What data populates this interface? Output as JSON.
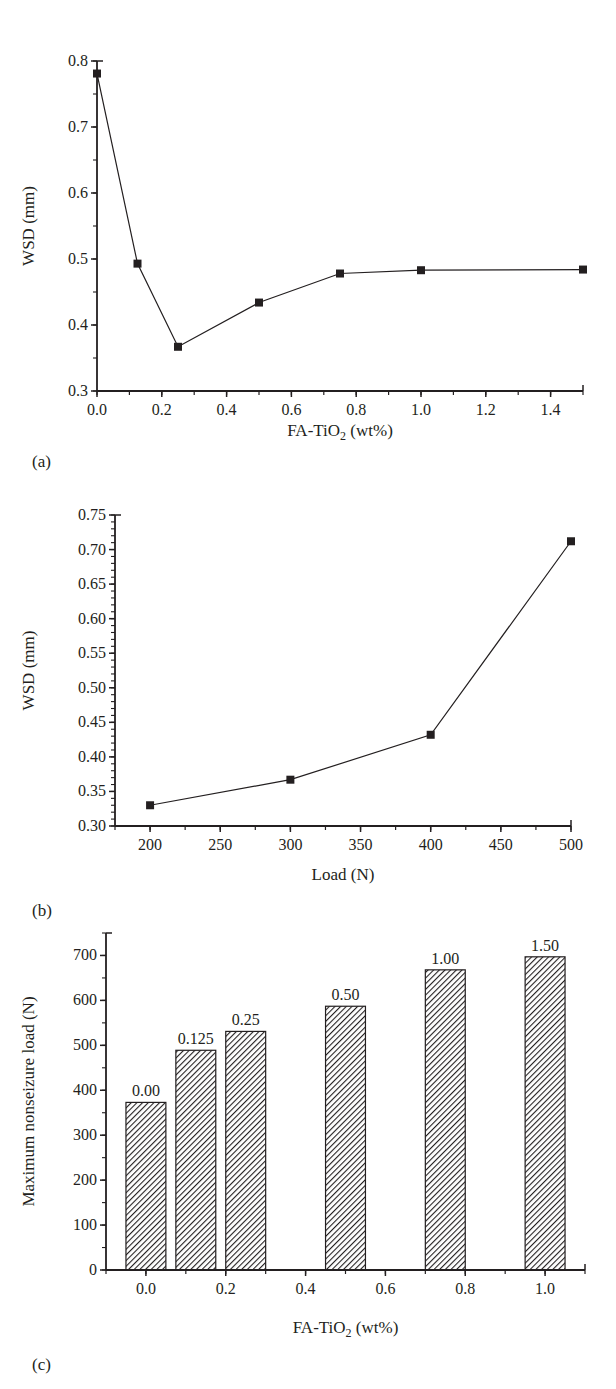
{
  "chart_data": [
    {
      "panel": "(a)",
      "type": "line",
      "title": "",
      "xlabel": "FA-TiO2 (wt%)",
      "ylabel": "WSD (mm)",
      "xlim": [
        0.0,
        1.5
      ],
      "ylim": [
        0.3,
        0.8
      ],
      "xticks": [
        0.0,
        0.2,
        0.4,
        0.6,
        0.8,
        1.0,
        1.2,
        1.4
      ],
      "xtick_labels": [
        "0.0",
        "0.2",
        "0.4",
        "0.6",
        "0.8",
        "1.0",
        "1.2",
        "1.4"
      ],
      "yticks": [
        0.3,
        0.4,
        0.5,
        0.6,
        0.7,
        0.8
      ],
      "ytick_labels": [
        "0.3",
        "0.4",
        "0.5",
        "0.6",
        "0.7",
        "0.8"
      ],
      "grid": false,
      "legend": null,
      "marker": "square",
      "series": [
        {
          "name": "WSD",
          "x": [
            0.0,
            0.125,
            0.25,
            0.5,
            0.75,
            1.0,
            1.5
          ],
          "y": [
            0.781,
            0.493,
            0.367,
            0.434,
            0.478,
            0.483,
            0.484
          ]
        }
      ]
    },
    {
      "panel": "(b)",
      "type": "line",
      "title": "",
      "xlabel": "Load (N)",
      "ylabel": "WSD (mm)",
      "xlim": [
        175,
        500
      ],
      "ylim": [
        0.3,
        0.75
      ],
      "xticks": [
        200,
        250,
        300,
        350,
        400,
        450,
        500
      ],
      "xtick_labels": [
        "200",
        "250",
        "300",
        "350",
        "400",
        "450",
        "500"
      ],
      "yticks": [
        0.3,
        0.35,
        0.4,
        0.45,
        0.5,
        0.55,
        0.6,
        0.65,
        0.7,
        0.75
      ],
      "ytick_labels": [
        "0.30",
        "0.35",
        "0.40",
        "0.45",
        "0.50",
        "0.55",
        "0.60",
        "0.65",
        "0.70",
        "0.75"
      ],
      "grid": false,
      "legend": null,
      "marker": "square",
      "series": [
        {
          "name": "WSD",
          "x": [
            200,
            300,
            400,
            500
          ],
          "y": [
            0.33,
            0.367,
            0.432,
            0.712
          ]
        }
      ]
    },
    {
      "panel": "(c)",
      "type": "bar",
      "title": "",
      "xlabel": "FA-TiO2 (wt%)",
      "ylabel": "Maximum nonseizure load (N)",
      "xlim": [
        -0.1,
        1.1
      ],
      "ylim": [
        0,
        750
      ],
      "xticks": [
        0.0,
        0.2,
        0.4,
        0.6,
        0.8,
        1.0
      ],
      "xtick_labels": [
        "0.0",
        "0.2",
        "0.4",
        "0.6",
        "0.8",
        "1.0"
      ],
      "yticks": [
        0,
        100,
        200,
        300,
        400,
        500,
        600,
        700
      ],
      "ytick_labels": [
        "0",
        "100",
        "200",
        "300",
        "400",
        "500",
        "600",
        "700"
      ],
      "grid": false,
      "legend": null,
      "fill": "diagonal-hatch",
      "bar_width": 0.1,
      "categories": [
        "0.00",
        "0.125",
        "0.25",
        "0.50",
        "1.00",
        "1.50"
      ],
      "x": [
        0.0,
        0.125,
        0.25,
        0.5,
        0.75,
        1.0
      ],
      "values": [
        373,
        489,
        531,
        587,
        668,
        697
      ]
    }
  ],
  "panel_labels": [
    "(a)",
    "(b)",
    "(c)"
  ],
  "colors": {
    "ink": "#231f20",
    "background": "#ffffff"
  }
}
